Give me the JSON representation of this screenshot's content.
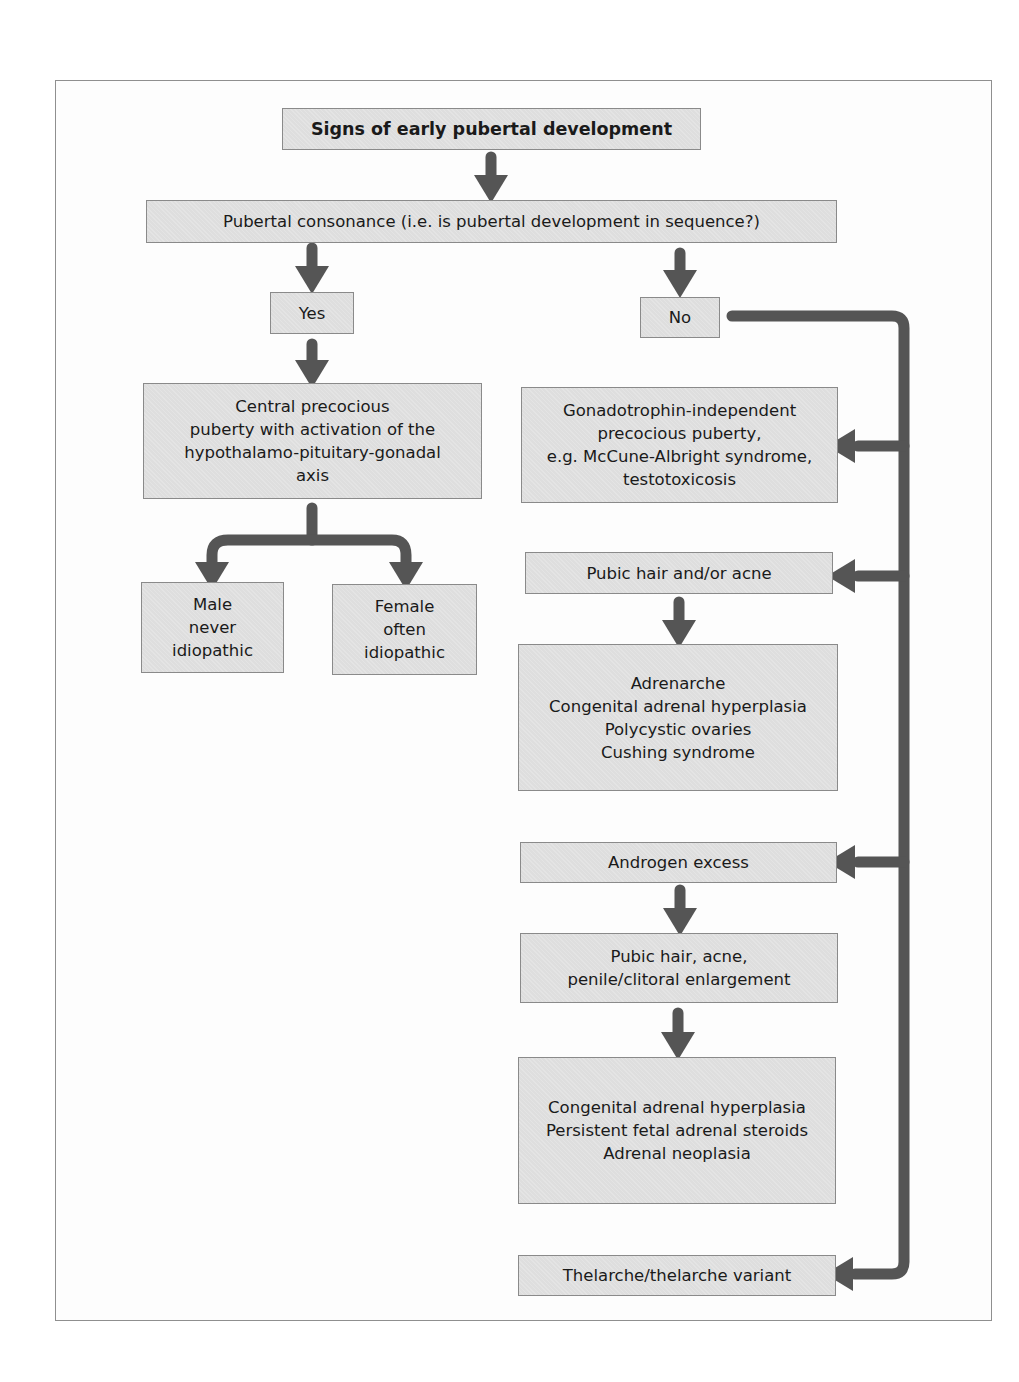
{
  "diagram": {
    "title": "Signs of early pubertal development",
    "question": "Pubertal consonance (i.e. is pubertal development in sequence?)",
    "yes_branch": {
      "label": "Yes",
      "result": "Central precocious\npuberty with activation of the\nhypothalamo-pituitary-gonadal\naxis",
      "male": "Male\nnever\nidiopathic",
      "female": "Female\noften\nidiopathic"
    },
    "no_branch": {
      "label": "No",
      "gonadotrophin": "Gonadotrophin-independent\nprecocious puberty,\ne.g. McCune-Albright syndrome,\ntestotoxicosis",
      "pubic_hair": "Pubic hair and/or acne",
      "pubic_hair_causes": "Adrenarche\nCongenital adrenal hyperplasia\nPolycystic ovaries\nCushing syndrome",
      "androgen": "Androgen excess",
      "androgen_signs": "Pubic hair, acne,\npenile/clitoral enlargement",
      "androgen_causes": "Congenital adrenal hyperplasia\nPersistent fetal adrenal steroids\nAdrenal neoplasia",
      "thelarche": "Thelarche/thelarche variant"
    },
    "colors": {
      "box_fill": "#dedede",
      "box_border": "#8a8a8a",
      "arrow": "#555555",
      "frame_border": "#8f8f8f"
    }
  }
}
